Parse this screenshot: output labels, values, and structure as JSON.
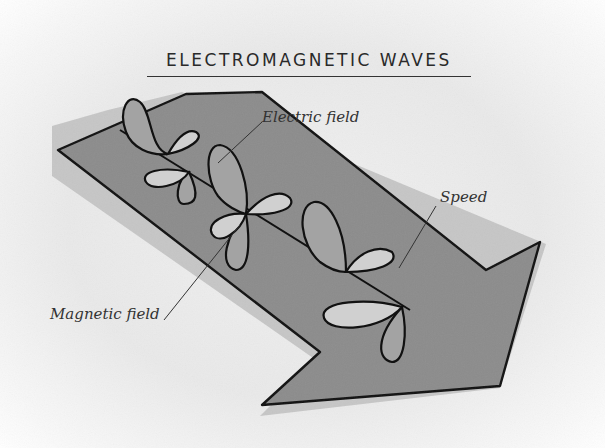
{
  "title": "ELECTROMAGNETIC WAVES",
  "labels": {
    "electric_field": "Electric field",
    "magnetic_field": "Magnetic field",
    "speed": "Speed"
  },
  "colors": {
    "arrow_fill": "#8a8a8a",
    "arrow_shadow": "#c4c4c4",
    "electric_lobe": "#a2a2a2",
    "magnetic_lobe": "#cfcfcf",
    "outline": "#111111",
    "background": "#ececec"
  }
}
